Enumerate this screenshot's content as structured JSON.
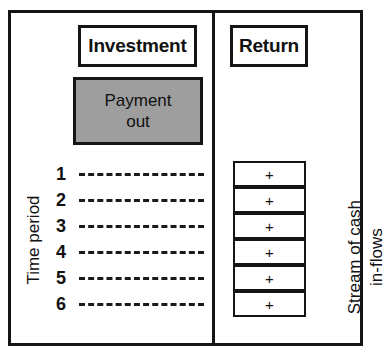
{
  "diagram": {
    "colors": {
      "frame": "#151515",
      "payment_fill": "#9e9e9e",
      "background": "#ffffff",
      "text": "#111111"
    },
    "left_panel": {
      "header_label": "Investment",
      "payment_block": {
        "line1": "Payment",
        "line2": "out"
      },
      "axis_label": "Time period",
      "periods": [
        {
          "number": "1"
        },
        {
          "number": "2"
        },
        {
          "number": "3"
        },
        {
          "number": "4"
        },
        {
          "number": "5"
        },
        {
          "number": "6"
        }
      ]
    },
    "right_panel": {
      "header_label": "Return",
      "axis_label_line1": "Stream of cash",
      "axis_label_line2": "in-flows",
      "inflows": [
        {
          "sign": "+"
        },
        {
          "sign": "+"
        },
        {
          "sign": "+"
        },
        {
          "sign": "+"
        },
        {
          "sign": "+"
        },
        {
          "sign": "+"
        }
      ]
    }
  }
}
